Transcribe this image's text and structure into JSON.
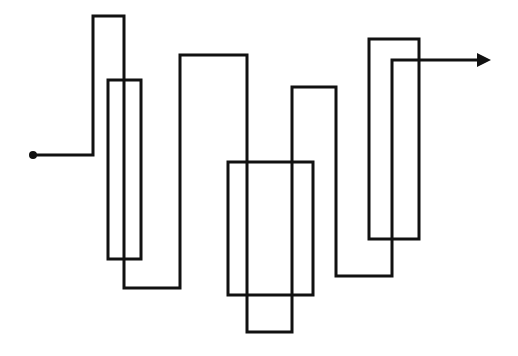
{
  "diagram": {
    "type": "line-diagram",
    "width": 518,
    "height": 356,
    "background": "#ffffff",
    "stroke_color": "#111111",
    "stroke_width": 3,
    "path": {
      "start_marker": "dot",
      "end_marker": "arrow",
      "points": [
        [
          33,
          155
        ],
        [
          93,
          155
        ],
        [
          93,
          16
        ],
        [
          124,
          16
        ],
        [
          124,
          288
        ],
        [
          180,
          288
        ],
        [
          180,
          55
        ],
        [
          247,
          55
        ],
        [
          247,
          332
        ],
        [
          292,
          332
        ],
        [
          292,
          87
        ],
        [
          336,
          87
        ],
        [
          336,
          276
        ],
        [
          392,
          276
        ],
        [
          392,
          60
        ],
        [
          480,
          60
        ]
      ]
    },
    "arrow_tip": [
      491,
      60
    ],
    "rectangles": [
      {
        "x": 108,
        "y": 80,
        "w": 33,
        "h": 179
      },
      {
        "x": 228,
        "y": 162,
        "w": 85,
        "h": 133
      },
      {
        "x": 369,
        "y": 39,
        "w": 50,
        "h": 200
      }
    ]
  }
}
